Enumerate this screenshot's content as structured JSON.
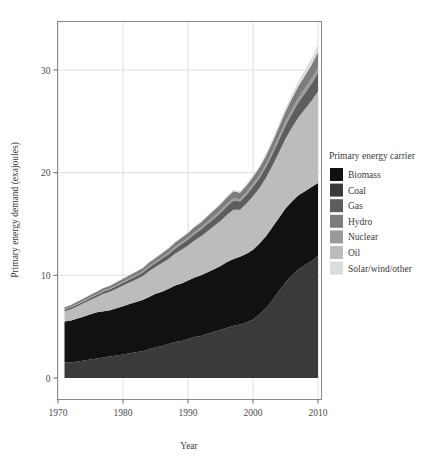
{
  "legend": {
    "title": "Primary energy carrier",
    "items": [
      {
        "label": "Biomass",
        "color": "#111111"
      },
      {
        "label": "Coal",
        "color": "#3a3a3a"
      },
      {
        "label": "Gas",
        "color": "#5d5d5d"
      },
      {
        "label": "Hydro",
        "color": "#7d7d7d"
      },
      {
        "label": "Nuclear",
        "color": "#9a9a9a"
      },
      {
        "label": "Oil",
        "color": "#bcbcbc"
      },
      {
        "label": "Solar/wind/other",
        "color": "#dcdcdc"
      }
    ]
  },
  "axes": {
    "x": {
      "label": "Year",
      "ticks": [
        1970,
        1980,
        1990,
        2000,
        2010
      ],
      "tick_labels": [
        "1970",
        "1980",
        "1990",
        "2000",
        "2010"
      ],
      "min": 1970,
      "max": 2011
    },
    "y": {
      "label": "Primary energy demand (exajoules)",
      "ticks": [
        0,
        10,
        20,
        30
      ],
      "tick_labels": [
        "0",
        "10",
        "20",
        "30"
      ],
      "min": 0,
      "max": 34
    }
  },
  "chart_data": {
    "type": "area",
    "title": "",
    "subtitle": "",
    "xlabel": "Year",
    "ylabel": "Primary energy demand (exajoules)",
    "xlim": [
      1970,
      2011
    ],
    "ylim": [
      0,
      34
    ],
    "grid": true,
    "legend_position": "right",
    "legend_title": "Primary energy carrier",
    "stacked": true,
    "stack_order_bottom_to_top": [
      "Coal",
      "Biomass",
      "Oil",
      "Gas",
      "Nuclear",
      "Hydro",
      "Solar/wind/other"
    ],
    "x": [
      1971,
      1972,
      1973,
      1974,
      1975,
      1976,
      1977,
      1978,
      1979,
      1980,
      1981,
      1982,
      1983,
      1984,
      1985,
      1986,
      1987,
      1988,
      1989,
      1990,
      1991,
      1992,
      1993,
      1994,
      1995,
      1996,
      1997,
      1998,
      1999,
      2000,
      2001,
      2002,
      2003,
      2004,
      2005,
      2006,
      2007,
      2008,
      2009,
      2010
    ],
    "series": [
      {
        "name": "Coal",
        "color": "#3a3a3a",
        "values": [
          1.5,
          1.5,
          1.6,
          1.7,
          1.8,
          1.9,
          2.0,
          2.1,
          2.2,
          2.3,
          2.4,
          2.5,
          2.6,
          2.8,
          3.0,
          3.1,
          3.3,
          3.5,
          3.6,
          3.8,
          4.0,
          4.1,
          4.3,
          4.5,
          4.7,
          4.9,
          5.1,
          5.2,
          5.4,
          5.7,
          6.2,
          6.8,
          7.6,
          8.5,
          9.3,
          10.0,
          10.6,
          11.0,
          11.4,
          11.9
        ]
      },
      {
        "name": "Biomass",
        "color": "#111111",
        "values": [
          4.0,
          4.1,
          4.2,
          4.3,
          4.4,
          4.5,
          4.5,
          4.5,
          4.6,
          4.7,
          4.8,
          4.9,
          5.0,
          5.1,
          5.2,
          5.3,
          5.4,
          5.5,
          5.6,
          5.7,
          5.8,
          5.9,
          6.0,
          6.1,
          6.2,
          6.4,
          6.5,
          6.6,
          6.7,
          6.8,
          6.9,
          7.0,
          7.1,
          7.1,
          7.2,
          7.2,
          7.2,
          7.2,
          7.2,
          7.1
        ]
      },
      {
        "name": "Oil",
        "color": "#bcbcbc",
        "values": [
          1.0,
          1.1,
          1.2,
          1.3,
          1.4,
          1.5,
          1.7,
          1.8,
          1.9,
          2.0,
          2.1,
          2.2,
          2.3,
          2.5,
          2.6,
          2.8,
          2.9,
          3.1,
          3.3,
          3.4,
          3.6,
          3.8,
          4.0,
          4.2,
          4.4,
          4.6,
          4.8,
          4.6,
          4.9,
          5.2,
          5.4,
          5.7,
          6.0,
          6.4,
          6.8,
          7.2,
          7.6,
          8.0,
          8.4,
          8.9
        ]
      },
      {
        "name": "Gas",
        "color": "#5d5d5d",
        "values": [
          0.15,
          0.16,
          0.17,
          0.18,
          0.19,
          0.2,
          0.22,
          0.24,
          0.26,
          0.28,
          0.3,
          0.32,
          0.34,
          0.37,
          0.4,
          0.43,
          0.46,
          0.5,
          0.54,
          0.58,
          0.62,
          0.66,
          0.7,
          0.74,
          0.79,
          0.84,
          0.88,
          0.8,
          0.86,
          0.92,
          0.98,
          1.05,
          1.12,
          1.2,
          1.28,
          1.36,
          1.45,
          1.55,
          1.65,
          1.8
        ]
      },
      {
        "name": "Nuclear",
        "color": "#9a9a9a",
        "values": [
          0.05,
          0.05,
          0.06,
          0.06,
          0.07,
          0.07,
          0.08,
          0.08,
          0.09,
          0.09,
          0.1,
          0.1,
          0.11,
          0.12,
          0.12,
          0.13,
          0.14,
          0.15,
          0.16,
          0.17,
          0.18,
          0.19,
          0.2,
          0.21,
          0.22,
          0.23,
          0.24,
          0.22,
          0.24,
          0.26,
          0.28,
          0.3,
          0.32,
          0.35,
          0.38,
          0.41,
          0.44,
          0.47,
          0.5,
          0.55
        ]
      },
      {
        "name": "Hydro",
        "color": "#7d7d7d",
        "values": [
          0.2,
          0.21,
          0.22,
          0.23,
          0.24,
          0.25,
          0.26,
          0.27,
          0.28,
          0.3,
          0.31,
          0.32,
          0.34,
          0.36,
          0.38,
          0.4,
          0.42,
          0.44,
          0.46,
          0.48,
          0.5,
          0.52,
          0.55,
          0.58,
          0.61,
          0.64,
          0.67,
          0.62,
          0.66,
          0.7,
          0.75,
          0.8,
          0.86,
          0.93,
          1.0,
          1.08,
          1.16,
          1.25,
          1.35,
          1.5
        ]
      },
      {
        "name": "Solar/wind/other",
        "color": "#dcdcdc",
        "values": [
          0.02,
          0.02,
          0.02,
          0.02,
          0.03,
          0.03,
          0.03,
          0.03,
          0.04,
          0.04,
          0.04,
          0.05,
          0.05,
          0.05,
          0.06,
          0.06,
          0.07,
          0.07,
          0.08,
          0.08,
          0.09,
          0.1,
          0.11,
          0.12,
          0.13,
          0.14,
          0.15,
          0.14,
          0.16,
          0.18,
          0.2,
          0.23,
          0.26,
          0.3,
          0.35,
          0.4,
          0.46,
          0.53,
          0.62,
          0.75
        ]
      }
    ],
    "totals": [
      6.9,
      7.1,
      7.3,
      7.8,
      8.1,
      8.4,
      8.8,
      9.0,
      9.4,
      9.7,
      10.1,
      10.3,
      10.7,
      11.3,
      11.9,
      12.3,
      12.9,
      13.5,
      13.9,
      14.4,
      14.9,
      15.4,
      15.9,
      16.5,
      17.1,
      17.8,
      18.4,
      18.2,
      19.0,
      19.8,
      20.7,
      21.9,
      23.3,
      24.8,
      26.3,
      27.7,
      29.1,
      30.1,
      31.2,
      32.5
    ]
  }
}
